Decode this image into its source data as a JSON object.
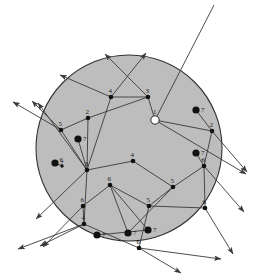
{
  "figure": {
    "background_color": "#ffffff",
    "disk": {
      "fill": "#bdbdbd",
      "stroke": "#333333",
      "cx": 129,
      "cy": 148,
      "r": 93
    },
    "edge_color": "#3a3a3a",
    "ray_color": "#3a3a3a",
    "vertex_fill": "#111111",
    "hollow_vertex_fill": "#ffffff",
    "label_color": "#1a1a1a"
  },
  "chart_data": {
    "type": "scatter",
    "xlabel": "",
    "ylabel": "",
    "xlim": [
      0,
      258
    ],
    "ylim": [
      0,
      280
    ],
    "grid": false,
    "legend": "none",
    "graph_vertices": [
      {
        "label": "1",
        "x": 155,
        "y": 120,
        "style": "hollow",
        "r": 4.2
      },
      {
        "label": "2",
        "x": 88,
        "y": 118,
        "style": "small",
        "r": 2.3
      },
      {
        "label": "2",
        "x": 212,
        "y": 131,
        "style": "small",
        "r": 2.3
      },
      {
        "label": "3",
        "x": 148,
        "y": 97,
        "style": "small",
        "r": 2.3
      },
      {
        "label": "3",
        "x": 87,
        "y": 170,
        "style": "small",
        "r": 2.3
      },
      {
        "label": "4",
        "x": 111,
        "y": 97,
        "style": "small",
        "r": 2.3
      },
      {
        "label": "4",
        "x": 133,
        "y": 161,
        "style": "small",
        "r": 2.3
      },
      {
        "label": "4",
        "x": 84,
        "y": 224,
        "style": "small",
        "r": 2.3
      },
      {
        "label": "5",
        "x": 61,
        "y": 130,
        "style": "small",
        "r": 2.3
      },
      {
        "label": "5",
        "x": 173,
        "y": 187,
        "style": "small",
        "r": 2.3
      },
      {
        "label": "5",
        "x": 149,
        "y": 206,
        "style": "small",
        "r": 2.3
      },
      {
        "label": "6",
        "x": 110,
        "y": 185,
        "style": "small",
        "r": 2.3
      },
      {
        "label": "6",
        "x": 83,
        "y": 206,
        "style": "small",
        "r": 2.3
      },
      {
        "label": "6",
        "x": 204,
        "y": 166,
        "style": "small",
        "r": 2.3
      },
      {
        "label": "6",
        "x": 205,
        "y": 208,
        "style": "small",
        "r": 2.3
      },
      {
        "label": "6",
        "x": 139,
        "y": 248,
        "style": "small",
        "r": 2.3
      },
      {
        "label": "6",
        "x": 62,
        "y": 166,
        "style": "tiny",
        "r": 1.7
      }
    ],
    "isolated_points": [
      {
        "label": "7",
        "x": 78,
        "y": 139,
        "style": "filled",
        "r": 3.6
      },
      {
        "label": "7",
        "x": 55,
        "y": 163,
        "style": "filled",
        "r": 3.6
      },
      {
        "label": "7",
        "x": 196,
        "y": 110,
        "style": "filled",
        "r": 3.6
      },
      {
        "label": "7",
        "x": 196,
        "y": 153,
        "style": "filled",
        "r": 3.6
      },
      {
        "label": "7",
        "x": 97,
        "y": 235,
        "style": "filled",
        "r": 3.6
      },
      {
        "label": "7",
        "x": 128,
        "y": 233,
        "style": "filled",
        "r": 3.6
      },
      {
        "label": "7",
        "x": 148,
        "y": 230,
        "style": "filled",
        "r": 3.6
      }
    ],
    "edges": [
      [
        111,
        97,
        148,
        97
      ],
      [
        148,
        97,
        155,
        120
      ],
      [
        155,
        120,
        212,
        131
      ],
      [
        148,
        97,
        88,
        118
      ],
      [
        88,
        118,
        61,
        130
      ],
      [
        88,
        118,
        87,
        170
      ],
      [
        111,
        97,
        87,
        170
      ],
      [
        61,
        130,
        87,
        170
      ],
      [
        87,
        170,
        133,
        161
      ],
      [
        133,
        161,
        173,
        187
      ],
      [
        173,
        187,
        204,
        166
      ],
      [
        204,
        166,
        212,
        131
      ],
      [
        173,
        187,
        149,
        206
      ],
      [
        149,
        206,
        110,
        185
      ],
      [
        110,
        185,
        83,
        206
      ],
      [
        83,
        206,
        84,
        224
      ],
      [
        87,
        170,
        84,
        224
      ],
      [
        149,
        206,
        205,
        208
      ],
      [
        205,
        208,
        204,
        166
      ],
      [
        149,
        206,
        139,
        248
      ],
      [
        84,
        224,
        139,
        248
      ],
      [
        110,
        185,
        128,
        233
      ],
      [
        97,
        235,
        148,
        230
      ],
      [
        196,
        110,
        212,
        131
      ],
      [
        196,
        153,
        204,
        166
      ],
      [
        55,
        163,
        62,
        166
      ],
      [
        78,
        139,
        87,
        170
      ]
    ],
    "rays": [
      {
        "x1": 155,
        "y1": 120,
        "x2": 214,
        "y2": 5,
        "arrow": "none"
      },
      {
        "x1": 155,
        "y1": 120,
        "x2": 246,
        "y2": 174,
        "arrow": "end"
      },
      {
        "x1": 148,
        "y1": 97,
        "x2": 105,
        "y2": 54,
        "arrow": "end"
      },
      {
        "x1": 111,
        "y1": 97,
        "x2": 146,
        "y2": 53,
        "arrow": "end"
      },
      {
        "x1": 111,
        "y1": 97,
        "x2": 60,
        "y2": 75,
        "arrow": "end"
      },
      {
        "x1": 61,
        "y1": 130,
        "x2": 13,
        "y2": 102,
        "arrow": "end"
      },
      {
        "x1": 61,
        "y1": 130,
        "x2": 32,
        "y2": 101,
        "arrow": "end"
      },
      {
        "x1": 87,
        "y1": 170,
        "x2": 38,
        "y2": 103,
        "arrow": "end"
      },
      {
        "x1": 87,
        "y1": 170,
        "x2": 36,
        "y2": 219,
        "arrow": "end"
      },
      {
        "x1": 83,
        "y1": 206,
        "x2": 43,
        "y2": 247,
        "arrow": "end"
      },
      {
        "x1": 84,
        "y1": 224,
        "x2": 40,
        "y2": 246,
        "arrow": "end"
      },
      {
        "x1": 84,
        "y1": 224,
        "x2": 18,
        "y2": 249,
        "arrow": "end"
      },
      {
        "x1": 139,
        "y1": 248,
        "x2": 181,
        "y2": 273,
        "arrow": "end"
      },
      {
        "x1": 139,
        "y1": 248,
        "x2": 221,
        "y2": 259,
        "arrow": "end"
      },
      {
        "x1": 205,
        "y1": 208,
        "x2": 233,
        "y2": 254,
        "arrow": "end"
      },
      {
        "x1": 204,
        "y1": 166,
        "x2": 244,
        "y2": 212,
        "arrow": "end"
      },
      {
        "x1": 212,
        "y1": 131,
        "x2": 247,
        "y2": 172,
        "arrow": "end"
      },
      {
        "x1": 173,
        "y1": 187,
        "x2": 128,
        "y2": 233,
        "arrow": "none"
      },
      {
        "x1": 110,
        "y1": 185,
        "x2": 148,
        "y2": 230,
        "arrow": "none"
      }
    ]
  }
}
